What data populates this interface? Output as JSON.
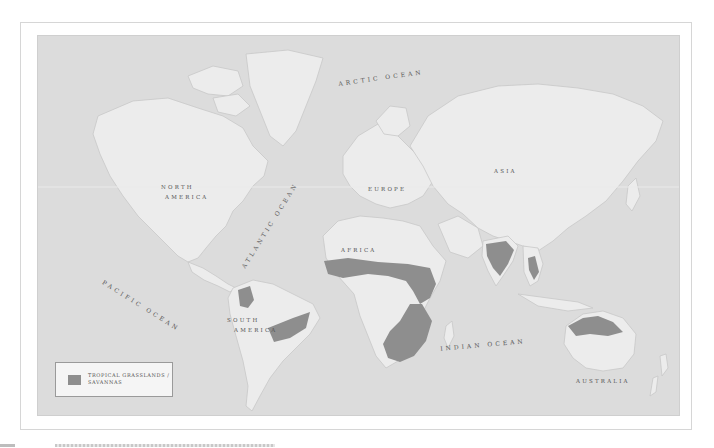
{
  "map": {
    "title_hidden": "",
    "colors": {
      "ocean": "#dcdcdc",
      "land": "#ececec",
      "coast": "#c8c8c8",
      "savanna": "#8e8e8e",
      "frame": "#d6d6d6",
      "label": "#555555"
    },
    "continent_labels": {
      "north_america_1": "NORTH",
      "north_america_2": "AMERICA",
      "south_america_1": "SOUTH",
      "south_america_2": "AMERICA",
      "europe": "EUROPE",
      "asia": "ASIA",
      "africa": "AFRICA",
      "australia": "AUSTRALIA"
    },
    "ocean_labels": {
      "arctic": "ARCTIC OCEAN",
      "atlantic": "ATLANTIC OCEAN",
      "pacific": "PACIFIC OCEAN",
      "indian": "INDIAN OCEAN"
    }
  },
  "legend": {
    "items": [
      {
        "label": "TROPICAL GRASSLANDS / SAVANNAS",
        "color": "#8e8e8e"
      }
    ]
  }
}
